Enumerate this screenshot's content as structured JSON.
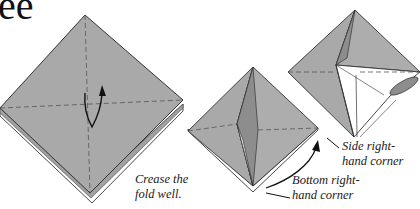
{
  "header": {
    "title_fragment": "ee"
  },
  "colors": {
    "paper": "#a9a9a9",
    "paper_shadow": "#8d8d8d",
    "paper_inside": "#ffffff",
    "outline": "#333333",
    "crease": "#555555"
  },
  "diagrams": [
    {
      "id": "step-crease",
      "caption": [
        "Crease the",
        "fold well."
      ]
    },
    {
      "id": "step-bottom-corner",
      "caption": [
        "Bottom right-",
        "hand corner"
      ]
    },
    {
      "id": "step-side-corner",
      "caption": [
        "Side right-",
        "hand corner"
      ]
    }
  ]
}
